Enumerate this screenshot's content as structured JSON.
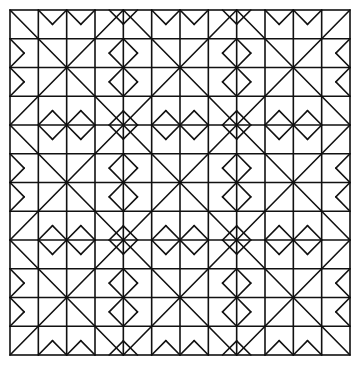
{
  "figure": {
    "kind": "geometric-line-pattern",
    "colors": {
      "line": "#111111",
      "background": "#ffffff"
    },
    "grid": {
      "blocks_x": 3,
      "blocks_y": 3,
      "units_per_block": 4
    },
    "bounds": {
      "x0": 10,
      "y0": 10,
      "x1": 350,
      "y1": 355
    }
  }
}
